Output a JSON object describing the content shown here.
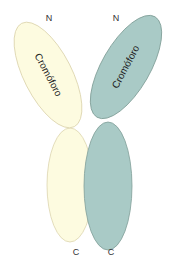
{
  "diagram": {
    "left_chain": {
      "top_label": "N",
      "bottom_label": "C",
      "domain_label": "Cromóforo",
      "color_fill": "#fdfbe0",
      "color_stroke": "#d8d0a8"
    },
    "right_chain": {
      "top_label": "N",
      "bottom_label": "C",
      "domain_label": "Cromóforo",
      "color_fill": "#a9cac6",
      "color_stroke": "#7f9f98"
    }
  }
}
